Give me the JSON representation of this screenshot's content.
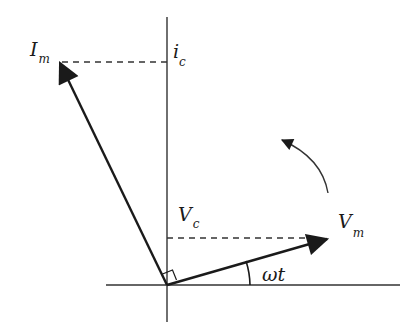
{
  "diagram": {
    "type": "phasor-diagram",
    "colors": {
      "stroke": "#1a1a1a",
      "axis": "#333333",
      "background": "#ffffff"
    },
    "labels": {
      "current_phasor": {
        "main": "I",
        "sub": "m"
      },
      "current_projection": {
        "main": "i",
        "sub": "c"
      },
      "voltage_phasor": {
        "main": "V",
        "sub": "m"
      },
      "voltage_projection": {
        "main": "V",
        "sub": "c"
      },
      "angle": "ωt"
    },
    "phasors": [
      {
        "name": "Im",
        "angle_deg": 112,
        "relation": "leads Vm by 90°"
      },
      {
        "name": "Vm",
        "angle_deg": 22
      }
    ],
    "rotation_direction": "counter-clockwise",
    "right_angle_marker": true
  }
}
